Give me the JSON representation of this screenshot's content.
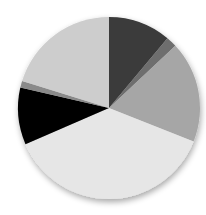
{
  "chart_data": {
    "type": "pie",
    "title": "",
    "legend": "none",
    "start_angle_deg": 0,
    "direction": "clockwise",
    "categories": [
      "Slice 1",
      "Slice 2",
      "Slice 3",
      "Slice 4",
      "Slice 5",
      "Slice 6",
      "Slice 7"
    ],
    "values": [
      11.1,
      1.9,
      18.0,
      37.5,
      10.1,
      1.2,
      20.2
    ],
    "colors": [
      "#3a3a3a",
      "#6e6e6e",
      "#a6a6a6",
      "#e6e6e6",
      "#050505",
      "#8a8a8a",
      "#cdcdcd"
    ]
  },
  "layout": {
    "cx": 109,
    "cy": 108,
    "r": 91
  }
}
